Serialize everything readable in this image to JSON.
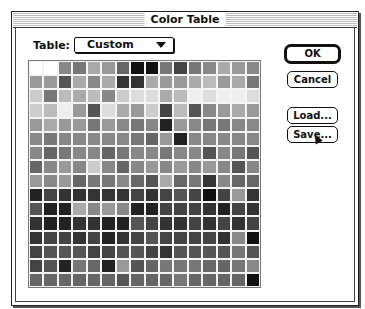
{
  "window": {
    "title": "Color Table"
  },
  "table": {
    "label": "Table:",
    "selected": "Custom"
  },
  "buttons": {
    "ok": "OK",
    "cancel": "Cancel",
    "load": "Load...",
    "save": "Save..."
  },
  "grid": {
    "rows": 16,
    "cols": 16,
    "colors": [
      [
        "#fff",
        "#fff",
        "#888",
        "#777",
        "#aaa",
        "#999",
        "#666",
        "#111",
        "#111",
        "#777",
        "#444",
        "#777",
        "#888",
        "#aaa",
        "#999",
        "#888"
      ],
      [
        "#999",
        "#999",
        "#555",
        "#aaa",
        "#888",
        "#aaa",
        "#333",
        "#333",
        "#aaa",
        "#999",
        "#999",
        "#aaa",
        "#bbb",
        "#999",
        "#aaa",
        "#777"
      ],
      [
        "#ccc",
        "#777",
        "#bbb",
        "#aaa",
        "#bbb",
        "#888",
        "#ccc",
        "#ddd",
        "#ddd",
        "#aaa",
        "#bbb",
        "#eee",
        "#ddd",
        "#eee",
        "#eee",
        "#ddd"
      ],
      [
        "#ccc",
        "#bbb",
        "#eee",
        "#999",
        "#555",
        "#ddd",
        "#aaa",
        "#999",
        "#ccc",
        "#444",
        "#bbb",
        "#555",
        "#888",
        "#999",
        "#aaa",
        "#999"
      ],
      [
        "#999",
        "#aaa",
        "#999",
        "#999",
        "#777",
        "#999",
        "#888",
        "#777",
        "#888",
        "#222",
        "#999",
        "#888",
        "#777",
        "#777",
        "#888",
        "#888"
      ],
      [
        "#888",
        "#777",
        "#888",
        "#888",
        "#888",
        "#888",
        "#888",
        "#777",
        "#666",
        "#999",
        "#222",
        "#888",
        "#888",
        "#888",
        "#888",
        "#888"
      ],
      [
        "#888",
        "#666",
        "#777",
        "#888",
        "#888",
        "#666",
        "#777",
        "#888",
        "#888",
        "#777",
        "#888",
        "#888",
        "#555",
        "#888",
        "#777",
        "#555"
      ],
      [
        "#666",
        "#888",
        "#999",
        "#888",
        "#ccc",
        "#888",
        "#666",
        "#888",
        "#999",
        "#888",
        "#999",
        "#888",
        "#999",
        "#888",
        "#555",
        "#888"
      ],
      [
        "#999",
        "#888",
        "#999",
        "#666",
        "#777",
        "#777",
        "#888",
        "#666",
        "#555",
        "#aaa",
        "#666",
        "#777",
        "#333",
        "#888",
        "#666",
        "#666"
      ],
      [
        "#222",
        "#444",
        "#333",
        "#333",
        "#333",
        "#333",
        "#333",
        "#444",
        "#333",
        "#444",
        "#555",
        "#444",
        "#111",
        "#444",
        "#999",
        "#333"
      ],
      [
        "#555",
        "#222",
        "#222",
        "#aaa",
        "#888",
        "#999",
        "#888",
        "#222",
        "#222",
        "#444",
        "#444",
        "#444",
        "#333",
        "#222",
        "#444",
        "#333"
      ],
      [
        "#333",
        "#222",
        "#222",
        "#333",
        "#333",
        "#222",
        "#222",
        "#555",
        "#444",
        "#333",
        "#333",
        "#444",
        "#333",
        "#444",
        "#333",
        "#444"
      ],
      [
        "#333",
        "#444",
        "#444",
        "#333",
        "#444",
        "#222",
        "#333",
        "#444",
        "#555",
        "#444",
        "#444",
        "#444",
        "#444",
        "#333",
        "#888",
        "#111"
      ],
      [
        "#444",
        "#555",
        "#555",
        "#555",
        "#444",
        "#444",
        "#555",
        "#555",
        "#444",
        "#333",
        "#555",
        "#555",
        "#555",
        "#555",
        "#777",
        "#555"
      ],
      [
        "#444",
        "#555",
        "#222",
        "#777",
        "#666",
        "#222",
        "#999",
        "#555",
        "#666",
        "#777",
        "#777",
        "#777",
        "#666",
        "#666",
        "#777",
        "#888"
      ],
      [
        "#666",
        "#666",
        "#666",
        "#666",
        "#666",
        "#666",
        "#555",
        "#666",
        "#666",
        "#666",
        "#777",
        "#666",
        "#666",
        "#666",
        "#666",
        "#111"
      ]
    ]
  }
}
